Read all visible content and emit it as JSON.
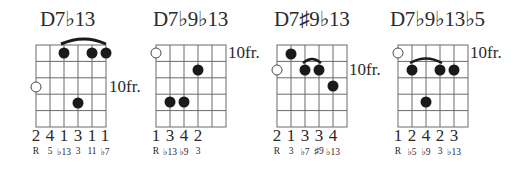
{
  "chords": [
    {
      "name": "D7♭13",
      "fret_label": "10fr.",
      "fret_label_row": 3,
      "open_circle": {
        "string": 1,
        "row": 3
      },
      "dots": [
        {
          "string": 3,
          "row": 1
        },
        {
          "string": 5,
          "row": 1
        },
        {
          "string": 6,
          "row": 1
        },
        {
          "string": 4,
          "row": 4
        }
      ],
      "slur": {
        "from": 3,
        "to": 6,
        "row": 1
      },
      "fingers": [
        "2",
        "4",
        "1",
        "3",
        "1",
        "1"
      ],
      "degrees": [
        "R",
        "5",
        "♭13",
        "3",
        "11",
        "♭7"
      ]
    },
    {
      "name": "D7♭9♭13",
      "fret_label": "10fr.",
      "fret_label_row": 1,
      "open_circle": {
        "string": 1,
        "row": 1
      },
      "dots": [
        {
          "string": 4,
          "row": 2
        },
        {
          "string": 2,
          "row": 4
        },
        {
          "string": 3,
          "row": 4
        }
      ],
      "slur": null,
      "fingers": [
        "1",
        "3",
        "4",
        "2"
      ],
      "degrees": [
        "R",
        "♭13",
        "♭9",
        "3"
      ]
    },
    {
      "name": "D7♯9♭13",
      "fret_label": "10fr.",
      "fret_label_row": 2,
      "open_circle": {
        "string": 1,
        "row": 2
      },
      "dots": [
        {
          "string": 2,
          "row": 1
        },
        {
          "string": 3,
          "row": 2
        },
        {
          "string": 4,
          "row": 2
        },
        {
          "string": 5,
          "row": 3
        }
      ],
      "slur": {
        "from": 3,
        "to": 4,
        "row": 2
      },
      "fingers": [
        "2",
        "1",
        "3",
        "3",
        "4"
      ],
      "degrees": [
        "R",
        "3",
        "♭7",
        "♯9",
        "♭13"
      ]
    },
    {
      "name": "D7♭9♭13♭5",
      "fret_label": "10fr.",
      "fret_label_row": 1,
      "open_circle": {
        "string": 1,
        "row": 1
      },
      "dots": [
        {
          "string": 2,
          "row": 2
        },
        {
          "string": 4,
          "row": 2
        },
        {
          "string": 5,
          "row": 2
        },
        {
          "string": 3,
          "row": 4
        }
      ],
      "slur": {
        "from": 2,
        "to": 4,
        "row": 2
      },
      "fingers": [
        "1",
        "2",
        "4",
        "2",
        "3"
      ],
      "degrees": [
        "R",
        "♭5",
        "♭9",
        "3",
        "♭13"
      ]
    }
  ]
}
